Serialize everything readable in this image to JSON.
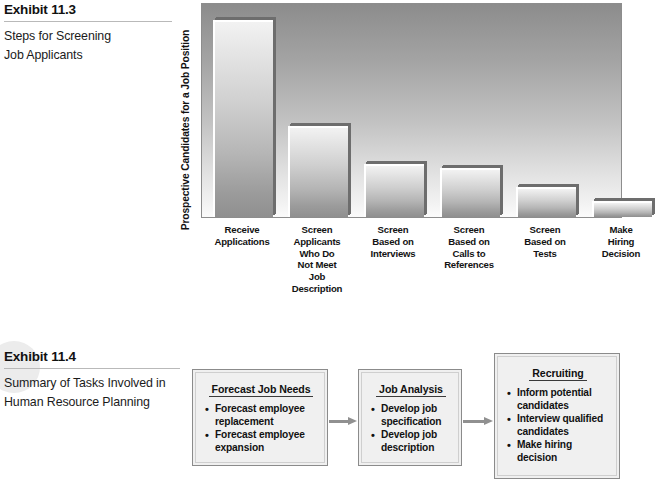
{
  "exhibit_113": {
    "title": "Exhibit 11.3",
    "subtitle_line1": "Steps for Screening",
    "subtitle_line2": "Job Applicants"
  },
  "exhibit_114": {
    "title": "Exhibit 11.4",
    "subtitle_line1": "Summary of Tasks Involved in",
    "subtitle_line2": "Human Resource Planning"
  },
  "chart_data": {
    "type": "bar",
    "title": "Steps for Screening Job Applicants",
    "xlabel": "",
    "ylabel": "Prospective Candidates for a Job Position",
    "categories": [
      "Receive Applications",
      "Screen Applicants Who Do Not Meet Job Description",
      "Screen Based on Interviews",
      "Screen Based on Calls to References",
      "Screen Based on Tests",
      "Make Hiring Decision"
    ],
    "category_lines": [
      [
        "Receive",
        "Applications"
      ],
      [
        "Screen",
        "Applicants",
        "Who Do",
        "Not Meet",
        "Job",
        "Description"
      ],
      [
        "Screen",
        "Based on",
        "Interviews"
      ],
      [
        "Screen",
        "Based on",
        "Calls to",
        "References"
      ],
      [
        "Screen",
        "Based on",
        "Tests"
      ],
      [
        "Make",
        "Hiring",
        "Decision"
      ]
    ],
    "values": [
      100,
      46,
      27,
      25,
      15,
      8
    ],
    "ylim": [
      0,
      108
    ],
    "grid": false,
    "legend": false,
    "bar_fill": "#c8c8c8",
    "bar_shadow": "#6d6d6d",
    "plot_background_top": "#8c8c8c",
    "plot_background_bottom": "#fbfbfb"
  },
  "flow": {
    "boxes": [
      {
        "heading": "Forecast Job Needs",
        "items": [
          "Forecast employee replacement",
          "Forecast employee expansion"
        ]
      },
      {
        "heading": "Job Analysis",
        "items": [
          "Develop job specification",
          "Develop job description"
        ]
      },
      {
        "heading": "Recruiting",
        "items": [
          "Inform potential candidates",
          "Interview qualified candidates",
          "Make hiring decision"
        ]
      }
    ],
    "arrow_color": "#909090"
  }
}
